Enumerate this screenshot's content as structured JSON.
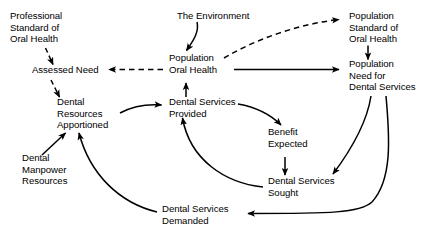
{
  "diagram": {
    "type": "causal-loop-diagram",
    "background_color": "#ffffff",
    "line_color": "#000000",
    "text_color": "#000000",
    "nodes": [
      {
        "id": "professional-standard",
        "label": "Professional\nStandard of\nOral Health",
        "x": 10,
        "y": 10
      },
      {
        "id": "the-environment",
        "label": "The Environment",
        "x": 177,
        "y": 10
      },
      {
        "id": "population-standard",
        "label": "Population\nStandard of\nOral Health",
        "x": 349,
        "y": 10
      },
      {
        "id": "assessed-need",
        "label": "Assessed Need",
        "x": 32,
        "y": 69
      },
      {
        "id": "population-oral-health",
        "label": "Population\nOral Health",
        "x": 169,
        "y": 57
      },
      {
        "id": "population-need",
        "label": "Population\nNeed for\nDental Services",
        "x": 349,
        "y": 63
      },
      {
        "id": "dental-resources-apportioned",
        "label": "Dental\nResources\nApportioned",
        "x": 57,
        "y": 101
      },
      {
        "id": "dental-services-provided",
        "label": "Dental Services\nProvided",
        "x": 169,
        "y": 101
      },
      {
        "id": "benefit-expected",
        "label": "Benefit\nExpected",
        "x": 268,
        "y": 131
      },
      {
        "id": "dental-manpower-resources",
        "label": "Dental\nManpower\nResources",
        "x": 22,
        "y": 157
      },
      {
        "id": "dental-services-sought",
        "label": "Dental Services\nSought",
        "x": 268,
        "y": 180
      },
      {
        "id": "dental-services-demanded",
        "label": "Dental Services\nDemanded",
        "x": 162,
        "y": 208
      }
    ],
    "edges": [
      {
        "id": "professional-standard-to-assessed-need",
        "from": "professional-standard",
        "to": "assessed-need",
        "style": "dashed"
      },
      {
        "id": "assessed-need-to-dental-resources",
        "from": "assessed-need",
        "to": "dental-resources-apportioned",
        "style": "dashed"
      },
      {
        "id": "population-oral-health-to-assessed-need",
        "from": "population-oral-health",
        "to": "assessed-need",
        "style": "dashed"
      },
      {
        "id": "population-oral-health-to-population-standard",
        "from": "population-oral-health",
        "to": "population-standard",
        "style": "dashed"
      },
      {
        "id": "the-environment-to-population-oral-health",
        "from": "the-environment",
        "to": "population-oral-health",
        "style": "solid"
      },
      {
        "id": "population-oral-health-to-population-need",
        "from": "population-oral-health",
        "to": "population-need",
        "style": "solid"
      },
      {
        "id": "population-standard-to-population-need",
        "from": "population-standard",
        "to": "population-need",
        "style": "solid"
      },
      {
        "id": "dental-resources-to-dental-services-provided",
        "from": "dental-resources-apportioned",
        "to": "dental-services-provided",
        "style": "solid"
      },
      {
        "id": "dental-services-provided-to-population-oral-health",
        "from": "dental-services-provided",
        "to": "population-oral-health",
        "style": "solid"
      },
      {
        "id": "dental-services-provided-to-benefit-expected",
        "from": "dental-services-provided",
        "to": "benefit-expected",
        "style": "solid"
      },
      {
        "id": "benefit-expected-to-dental-services-sought",
        "from": "benefit-expected",
        "to": "dental-services-sought",
        "style": "solid"
      },
      {
        "id": "population-need-to-dental-services-sought",
        "from": "population-need",
        "to": "dental-services-sought",
        "style": "solid"
      },
      {
        "id": "population-need-to-dental-services-demanded",
        "from": "population-need",
        "to": "dental-services-demanded",
        "style": "solid"
      },
      {
        "id": "dental-services-sought-to-dental-services-provided",
        "from": "dental-services-sought",
        "to": "dental-services-provided",
        "style": "solid"
      },
      {
        "id": "dental-manpower-to-dental-resources",
        "from": "dental-manpower-resources",
        "to": "dental-resources-apportioned",
        "style": "solid"
      },
      {
        "id": "dental-services-demanded-to-dental-resources",
        "from": "dental-services-demanded",
        "to": "dental-resources-apportioned",
        "style": "solid"
      }
    ]
  }
}
